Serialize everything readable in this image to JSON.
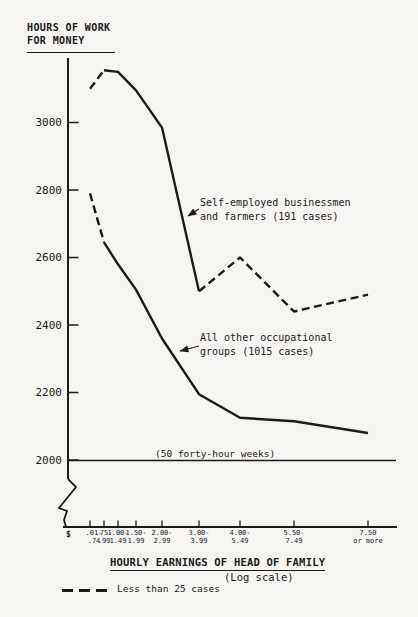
{
  "colors": {
    "ink": "#1b1b1b",
    "paper": "#f6f5f1"
  },
  "chart_data": {
    "type": "line",
    "title": "HOURS OF WORK FOR MONEY",
    "xlabel": "HOURLY EARNINGS OF HEAD OF FAMILY",
    "xlabel_sub": "(Log scale)",
    "x_scale": "log",
    "x_axis_prefix": "$",
    "ylabel": "HOURS OF WORK FOR MONEY",
    "ylabel_lines": {
      "line1": "HOURS OF WORK",
      "line2": "FOR MONEY"
    },
    "ylim": [
      2000,
      3200
    ],
    "y_ticks": [
      3000,
      2800,
      2600,
      2400,
      2200,
      2000
    ],
    "axis_break_below": 2000,
    "categories": [
      {
        "line1": ".01-",
        "line2": ".74"
      },
      {
        "line1": ".75-",
        "line2": ".99"
      },
      {
        "line1": "1.00-",
        "line2": "1.49"
      },
      {
        "line1": "1.50-",
        "line2": "1.99"
      },
      {
        "line1": "2.00-",
        "line2": "2.99"
      },
      {
        "line1": "3.00-",
        "line2": "3.99"
      },
      {
        "line1": "4.00-",
        "line2": "5.49"
      },
      {
        "line1": "5.50-",
        "line2": "7.49"
      },
      {
        "line1": "7.50",
        "line2": "or more"
      }
    ],
    "series": [
      {
        "name": "Self-employed businessmen and farmers (191 cases)",
        "values": [
          3100,
          3155,
          3150,
          3095,
          2985,
          2500,
          2600,
          2440,
          2490
        ],
        "segments": [
          {
            "from": 0,
            "to": 1,
            "style": "dashed"
          },
          {
            "from": 1,
            "to": 5,
            "style": "solid"
          },
          {
            "from": 5,
            "to": 8,
            "style": "dashed"
          }
        ]
      },
      {
        "name": "All other occupational groups (1015 cases)",
        "values": [
          2790,
          2645,
          2580,
          2505,
          2360,
          2195,
          2125,
          2115,
          2080
        ],
        "segments": [
          {
            "from": 0,
            "to": 1,
            "style": "dashed"
          },
          {
            "from": 1,
            "to": 8,
            "style": "solid"
          }
        ]
      }
    ],
    "reference_line": {
      "value": 2000,
      "label": "(50 forty-hour weeks)"
    },
    "legend": [
      {
        "style": "dashed",
        "label": "Less than 25 cases"
      }
    ],
    "dashed_meaning": "Less than 25 cases",
    "layout": {
      "x_positions_px": [
        90,
        104,
        118,
        136,
        162,
        199,
        240,
        294,
        368
      ],
      "y_value_2000_px": 460,
      "px_per_unit": 0.3375,
      "legend_position": "bottom-left",
      "grid": false
    }
  },
  "annotations": {
    "self_employed": {
      "line1": "Self-employed businessmen",
      "line2": "and farmers (191 cases)"
    },
    "all_other": {
      "line1": "All other occupational",
      "line2": "groups (1015 cases)"
    }
  }
}
